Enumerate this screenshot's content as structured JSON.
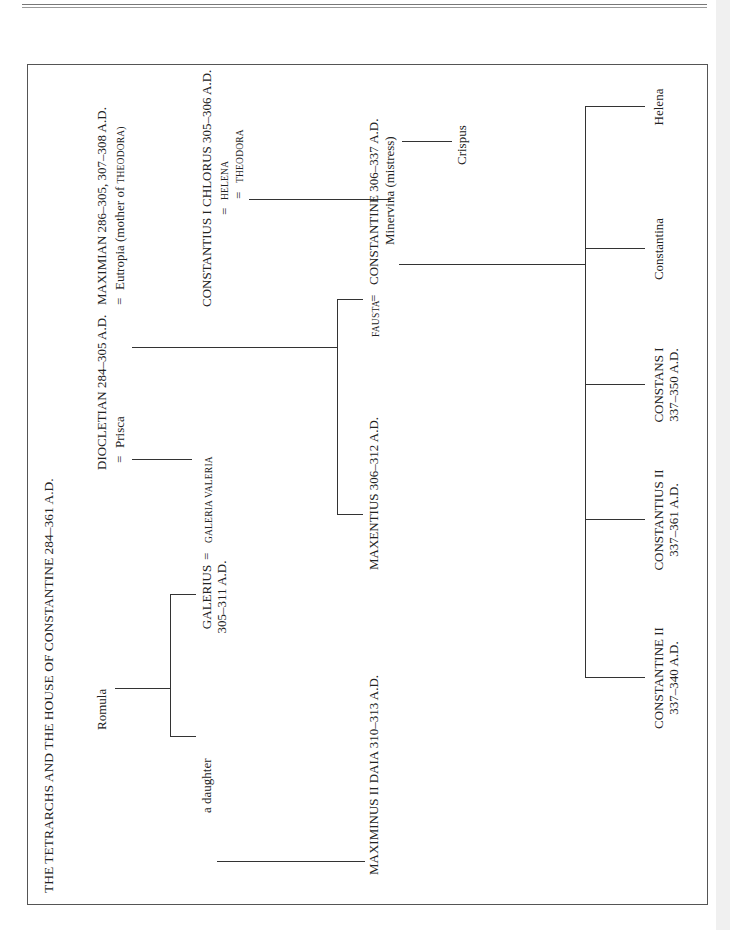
{
  "title": "THE TETRARCHS AND THE HOUSE OF CONSTANTINE 284–361 A.D.",
  "people": {
    "romula": "Romula",
    "diocletian": "DIOCLETIAN 284–305 A.D.",
    "prisca": "Prisca",
    "maximian": "MAXIMIAN 286–305, 307–308 A.D.",
    "eutropia": "Eutropia (mother of ",
    "eutropia_sc": "THEODORA)",
    "galerius": "GALERIUS",
    "galerius_dates": "305–311 A.D.",
    "galeria_valeria": "GALERIA VALERIA",
    "constantius_chlorus": "CONSTANTIUS I CHLORUS 305–306 A.D.",
    "helena_wife": "HELENA",
    "theodora": "THEODORA",
    "a_daughter": "a daughter",
    "maximinus": "MAXIMINUS II DAIA 310–313 A.D.",
    "maxentius": "MAXENTIUS 306–312 A.D.",
    "fausta": "FAUSTA",
    "constantine": "CONSTANTINE 306–337 A.D.",
    "minervina": "Minervina (mistress)",
    "crispus": "Crispus",
    "constantine_ii": "CONSTANTINE II",
    "constantine_ii_dates": "337–340 A.D.",
    "constantius_ii": "CONSTANTIUS II",
    "constantius_ii_dates": "337–361 A.D.",
    "constans_i": "CONSTANS I",
    "constans_i_dates": "337–350 A.D.",
    "constantina": "Constantina",
    "helena_daughter": "Helena"
  },
  "symbols": {
    "married": "="
  }
}
